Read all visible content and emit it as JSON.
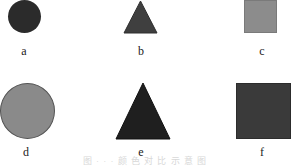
{
  "figure": {
    "shapes": [
      {
        "id": "a",
        "label": "a",
        "type": "circle",
        "size": "small",
        "color": "#2b2b2b"
      },
      {
        "id": "b",
        "label": "b",
        "type": "triangle",
        "size": "small",
        "color": "#3f3f3f"
      },
      {
        "id": "c",
        "label": "c",
        "type": "square",
        "size": "small",
        "color": "#8c8c8c"
      },
      {
        "id": "d",
        "label": "d",
        "type": "circle",
        "size": "large",
        "color": "#8a8a8a"
      },
      {
        "id": "e",
        "label": "e",
        "type": "triangle",
        "size": "large",
        "color": "#1f1f1f"
      },
      {
        "id": "f",
        "label": "f",
        "type": "square",
        "size": "large",
        "color": "#3a3a3a"
      }
    ],
    "caption": "图 · · ·  颜 色 对 比 示 意 图"
  }
}
